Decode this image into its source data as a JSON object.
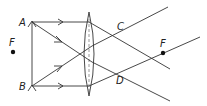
{
  "diagram": {
    "type": "optics-ray-diagram",
    "labels": {
      "A": "A",
      "B": "B",
      "F_left": "F",
      "F_right": "F",
      "C": "C",
      "D": "D"
    },
    "colors": {
      "line": "#333333",
      "background": "#ffffff"
    }
  }
}
